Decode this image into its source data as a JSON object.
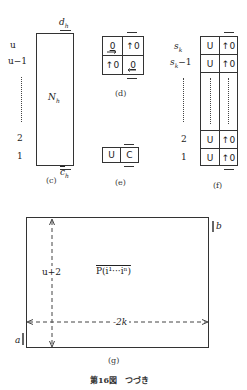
{
  "figure": {
    "caption": "第16図　つづき",
    "panels": {
      "c": {
        "caption": "(c)",
        "row_labels": [
          "u",
          "u−1",
          "2",
          "1"
        ],
        "center_label": "N",
        "center_sub": "h",
        "top_label": "d",
        "top_sub": "h",
        "bottom_label": "c",
        "bottom_sub": "h"
      },
      "d": {
        "caption": "(d)",
        "cells": [
          {
            "text": "0",
            "mark": "underline-arrow-right"
          },
          {
            "text": "↑0",
            "mark": "up-arrow"
          },
          {
            "text": "↑0",
            "mark": "up-arrow"
          },
          {
            "text": "0",
            "mark": "underline-arrow-left"
          }
        ]
      },
      "e": {
        "caption": "(e)",
        "cells": [
          "U",
          "C"
        ]
      },
      "f": {
        "caption": "(f)",
        "row_labels": [
          "s",
          "s",
          "2",
          "1"
        ],
        "row_label_subs": [
          "k",
          "k",
          "",
          ""
        ],
        "row_label_suffix": [
          "",
          "−1",
          "",
          ""
        ],
        "rows": [
          {
            "left": "U",
            "right": "↑0"
          },
          {
            "left": "U",
            "right": "↑0"
          },
          {
            "left": "U",
            "right": "↑0"
          },
          {
            "left": "U",
            "right": "↑0"
          }
        ]
      },
      "g": {
        "caption": "(g)",
        "center_label": "P(i¹···iⁿ)",
        "vertical_label": "u+2",
        "horizontal_label": "-2k",
        "corner_top_right": "b",
        "corner_bottom_left": "a"
      }
    }
  }
}
